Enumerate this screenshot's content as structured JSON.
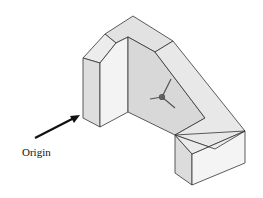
{
  "figure": {
    "annotation": {
      "label": "Origin"
    },
    "colors": {
      "face_light": "#f2f2f2",
      "face_mid": "#e4e4e4",
      "face_dark": "#d6d6d6",
      "edge": "#333333"
    }
  }
}
